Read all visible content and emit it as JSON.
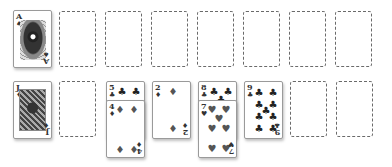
{
  "game": "Solitaire",
  "colors": {
    "background": "#ffffff",
    "slot_border": "#6a6a6a",
    "card_border": "#9a9a9a",
    "suit_color": "#222222"
  },
  "top_row": [
    {
      "type": "card",
      "rank": "A",
      "suit": "♠",
      "suit_name": "spades",
      "face": "ace-art"
    },
    {
      "type": "empty"
    },
    {
      "type": "empty"
    },
    {
      "type": "empty"
    },
    {
      "type": "empty"
    },
    {
      "type": "empty"
    },
    {
      "type": "empty"
    },
    {
      "type": "empty"
    }
  ],
  "bottom_row": [
    {
      "column": 1,
      "cards": [
        {
          "rank": "J",
          "suit": "♦",
          "suit_name": "diamonds",
          "face": "face-card"
        }
      ]
    },
    {
      "column": 2,
      "cards": []
    },
    {
      "column": 3,
      "cards": [
        {
          "rank": "5",
          "suit": "♣",
          "suit_name": "clubs"
        },
        {
          "rank": "4",
          "suit": "♦",
          "suit_name": "diamonds"
        }
      ]
    },
    {
      "column": 4,
      "cards": [
        {
          "rank": "2",
          "suit": "♦",
          "suit_name": "diamonds"
        }
      ]
    },
    {
      "column": 5,
      "cards": [
        {
          "rank": "8",
          "suit": "♣",
          "suit_name": "clubs"
        },
        {
          "rank": "7",
          "suit": "♥",
          "suit_name": "hearts"
        }
      ]
    },
    {
      "column": 6,
      "cards": [
        {
          "rank": "9",
          "suit": "♣",
          "suit_name": "clubs"
        }
      ]
    },
    {
      "column": 7,
      "cards": []
    },
    {
      "column": 8,
      "cards": []
    }
  ],
  "labels": {
    "ace_rank": "A",
    "ace_suit": "♠",
    "jack_rank": "J",
    "jack_suit": "♦",
    "five_rank": "5",
    "five_suit": "♣",
    "four_rank": "4",
    "four_suit": "♦",
    "two_rank": "2",
    "two_suit": "♦",
    "eight_rank": "8",
    "eight_suit": "♣",
    "seven_rank": "7",
    "seven_suit": "♥",
    "nine_rank": "9",
    "nine_suit": "♣"
  }
}
